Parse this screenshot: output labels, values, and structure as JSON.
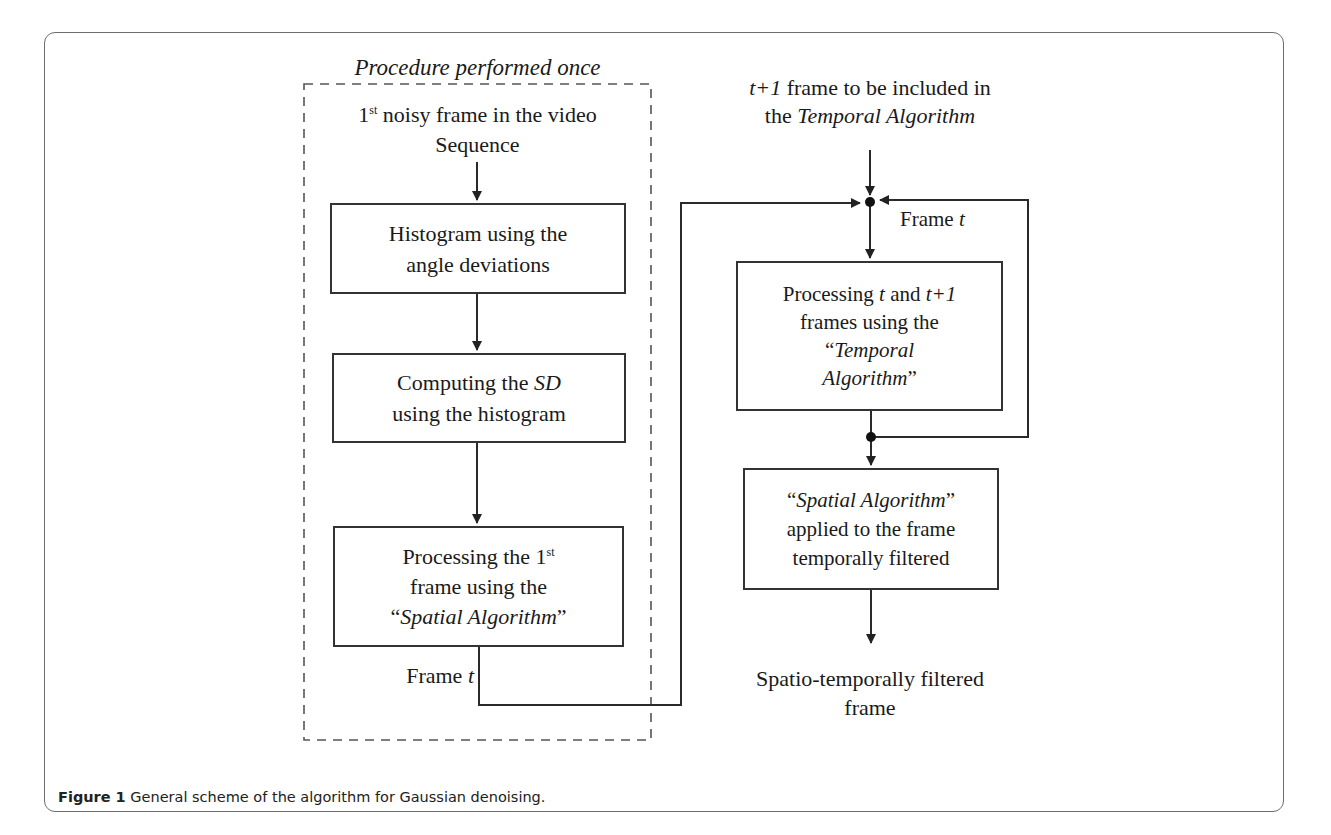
{
  "figure": {
    "caption_label": "Figure 1",
    "caption_text": " General scheme of the algorithm for Gaussian denoising."
  },
  "left_column": {
    "group_label": "Procedure performed once",
    "input_line1_prefix": "1",
    "input_line1_sup": "st",
    "input_line1_suffix": " noisy frame in the video",
    "input_line2": "Sequence",
    "box_histogram": {
      "line1": "Histogram using the",
      "line2": "angle deviations"
    },
    "box_sd": {
      "line1_prefix": "Computing the ",
      "line1_italic": "SD",
      "line2": "using the histogram"
    },
    "box_spatial_first": {
      "line1_prefix": "Processing the 1",
      "line1_sup": "st",
      "line2": "frame using the",
      "line3_open": "“",
      "line3_italic": "Spatial Algorithm",
      "line3_close": "”"
    },
    "output_label_prefix": "Frame ",
    "output_label_italic": "t"
  },
  "right_column": {
    "input_line1_italic": "t+1",
    "input_line1_suffix": " frame to be included in",
    "input_line2_prefix": "the ",
    "input_line2_italic": "Temporal Algorithm",
    "feedback_label_prefix": "Frame ",
    "feedback_label_italic": "t",
    "box_temporal": {
      "line1_prefix": "Processing ",
      "line1_italic1": "t",
      "line1_mid": " and ",
      "line1_italic2": "t+1",
      "line2": "frames using the",
      "line3_open": "“",
      "line3_italic": "Temporal",
      "line4_italic": "Algorithm",
      "line4_close": "”"
    },
    "box_spatial_applied": {
      "line1_open": "“",
      "line1_italic": "Spatial Algorithm",
      "line1_close": "”",
      "line2": "applied to the frame",
      "line3": "temporally filtered"
    },
    "output_line1": "Spatio-temporally filtered",
    "output_line2": "frame"
  },
  "colors": {
    "stroke": "#333333",
    "frame_border": "#6e6e6e",
    "text": "#1a1a1a"
  }
}
